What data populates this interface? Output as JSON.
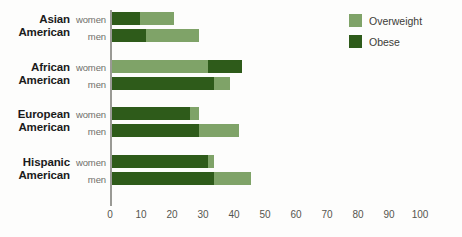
{
  "chart_data": {
    "type": "bar",
    "orientation": "horizontal",
    "stacked": true,
    "title": "",
    "xlabel": "",
    "ylabel": "",
    "xlim": [
      0,
      100
    ],
    "xticks": [
      0,
      10,
      20,
      30,
      40,
      50,
      60,
      70,
      80,
      90,
      100
    ],
    "grid": false,
    "legend_position": "top-right",
    "categories": [
      "Asian American women",
      "Asian American men",
      "African American women",
      "African American men",
      "European American women",
      "European American men",
      "Hispanic American women",
      "Hispanic American men"
    ],
    "series": [
      {
        "name": "Obese",
        "color": "#2e5b1a",
        "values": [
          9,
          11,
          11,
          33,
          25,
          28,
          31,
          33
        ]
      },
      {
        "name": "Overweight",
        "color": "#7fa368",
        "values": [
          11,
          17,
          31,
          5,
          3,
          13,
          2,
          12
        ]
      }
    ],
    "totals": [
      20,
      28,
      42,
      38,
      28,
      41,
      33,
      45
    ]
  },
  "groups": [
    {
      "line1": "Asian",
      "line2": "American",
      "rows": [
        {
          "label": "women",
          "obese": 9,
          "overweight": 11,
          "obese_first": true
        },
        {
          "label": "men",
          "obese": 11,
          "overweight": 17,
          "obese_first": true
        }
      ]
    },
    {
      "line1": "African",
      "line2": "American",
      "rows": [
        {
          "label": "women",
          "obese": 11,
          "overweight": 31,
          "obese_first": false
        },
        {
          "label": "men",
          "obese": 33,
          "overweight": 5,
          "obese_first": true
        }
      ]
    },
    {
      "line1": "European",
      "line2": "American",
      "rows": [
        {
          "label": "women",
          "obese": 25,
          "overweight": 3,
          "obese_first": true
        },
        {
          "label": "men",
          "obese": 28,
          "overweight": 13,
          "obese_first": true
        }
      ]
    },
    {
      "line1": "Hispanic",
      "line2": "American",
      "rows": [
        {
          "label": "women",
          "obese": 31,
          "overweight": 2,
          "obese_first": true
        },
        {
          "label": "men",
          "obese": 33,
          "overweight": 12,
          "obese_first": true
        }
      ]
    }
  ],
  "legend": {
    "items": [
      {
        "label": "Overweight",
        "color": "#7fa368"
      },
      {
        "label": "Obese",
        "color": "#2e5b1a"
      }
    ]
  },
  "axis": {
    "ticks": [
      "0",
      "10",
      "20",
      "30",
      "40",
      "50",
      "60",
      "70",
      "80",
      "90",
      "100"
    ]
  },
  "colors": {
    "obese": "#2e5b1a",
    "overweight": "#7fa368",
    "axis": "#9a9a95",
    "tick_text": "#55554f",
    "group_text": "#1b1b1b",
    "series_text": "#6f6f6a"
  }
}
